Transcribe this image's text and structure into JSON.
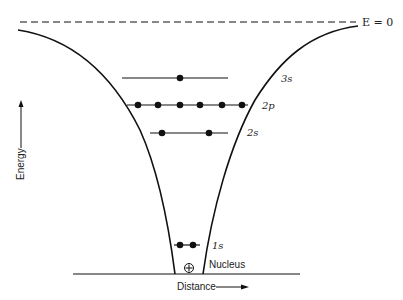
{
  "diagram": {
    "zero_energy_label": "E = 0",
    "axis": {
      "y_label": "Energy",
      "x_label": "Distance"
    },
    "nucleus_label": "Nucleus",
    "nucleus_symbol": "⊕",
    "levels": [
      {
        "name": "3s",
        "label": "3s",
        "electrons": 1
      },
      {
        "name": "2p",
        "label": "2p",
        "electrons": 6
      },
      {
        "name": "2s",
        "label": "2s",
        "electrons": 2
      },
      {
        "name": "1s",
        "label": "1s",
        "electrons": 2
      }
    ],
    "colors": {
      "line": "#111111",
      "background": "#ffffff"
    }
  }
}
